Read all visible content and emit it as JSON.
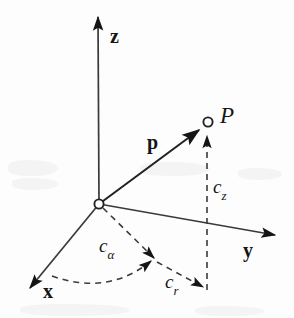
{
  "figure": {
    "kind": "cylindrical-coordinates-diagram",
    "background_color": "#fdfdfd",
    "ink_color": "#151515",
    "width": 294,
    "height": 318
  },
  "axes": [
    {
      "id": "z",
      "label": "z",
      "style": "bold-serif",
      "from": [
        99,
        204
      ],
      "to": [
        98,
        13
      ],
      "label_pos": [
        110,
        26
      ]
    },
    {
      "id": "y",
      "label": "y",
      "style": "bold-serif",
      "from": [
        99,
        204
      ],
      "to": [
        280,
        236
      ],
      "label_pos": [
        243,
        240
      ]
    },
    {
      "id": "x",
      "label": "x",
      "style": "bold-serif",
      "from": [
        99,
        204
      ],
      "to": [
        25,
        293
      ],
      "label_pos": [
        43,
        281
      ]
    }
  ],
  "origin": {
    "label": "",
    "pos": [
      99,
      204
    ],
    "marker": "open-circle",
    "radius": 4.5
  },
  "point": {
    "label": "P",
    "style": "italic-serif",
    "pos": [
      208,
      122
    ],
    "marker": "open-circle",
    "radius": 4.5,
    "label_pos": [
      220,
      104
    ]
  },
  "vector": {
    "label": "p",
    "style": "bold-serif",
    "from": [
      99,
      204
    ],
    "to": [
      202,
      128
    ],
    "label_pos": [
      147,
      132
    ]
  },
  "components": [
    {
      "id": "c_z",
      "label": "c",
      "subscript": "z",
      "line_style": "dashed",
      "from": [
        207,
        290
      ],
      "to": [
        207,
        131
      ],
      "label_pos": [
        213,
        177
      ]
    },
    {
      "id": "c_r",
      "label": "c",
      "subscript": "r",
      "line_style": "dashed",
      "from": [
        157,
        262
      ],
      "to": [
        206,
        289
      ],
      "label_pos": [
        165,
        272
      ]
    },
    {
      "id": "c_alpha",
      "label": "c",
      "subscript": "α",
      "line_style": "dashed-arc",
      "arc_from": [
        52,
        276
      ],
      "arc_to": [
        159,
        263
      ],
      "label_pos": [
        99,
        236
      ]
    }
  ],
  "guide_lines": [
    {
      "id": "radial-projection",
      "line_style": "dashed",
      "from": [
        99,
        204
      ],
      "to": [
        157,
        262
      ],
      "arrow": true
    }
  ]
}
